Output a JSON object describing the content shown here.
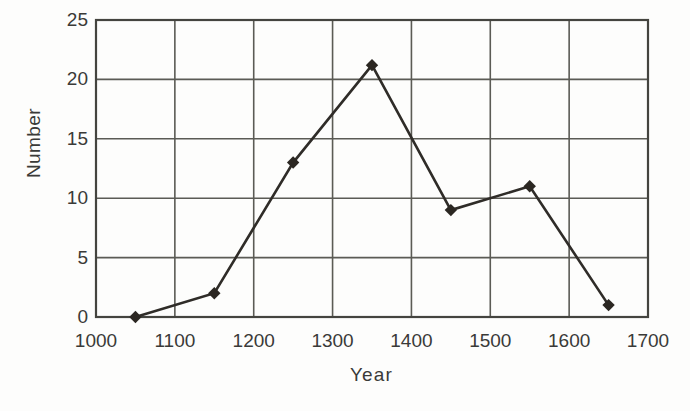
{
  "chart_data": {
    "type": "line",
    "title": "",
    "xlabel": "Year",
    "ylabel": "Number",
    "x": [
      1050,
      1150,
      1250,
      1350,
      1450,
      1550,
      1650
    ],
    "values": [
      0,
      2,
      13,
      21.2,
      9,
      11,
      1
    ],
    "series": [
      {
        "name": "Number",
        "x": [
          1050,
          1150,
          1250,
          1350,
          1450,
          1550,
          1650
        ],
        "values": [
          0,
          2,
          13,
          21.2,
          9,
          11,
          1
        ]
      }
    ],
    "xlim": [
      1000,
      1700
    ],
    "ylim": [
      0,
      25
    ],
    "xticks": [
      1000,
      1100,
      1200,
      1300,
      1400,
      1500,
      1600,
      1700
    ],
    "xtick_labels": [
      "1000",
      "1100",
      "1200",
      "1300",
      "1400",
      "1500",
      "1600",
      "1700"
    ],
    "yticks": [
      0,
      5,
      10,
      15,
      20,
      25
    ],
    "ytick_labels": [
      "0",
      "5",
      "10",
      "15",
      "20",
      "25"
    ],
    "grid": true,
    "grid_x": [
      1100,
      1200,
      1300,
      1400,
      1500,
      1600
    ],
    "grid_y": [
      5,
      10,
      15,
      20
    ],
    "legend": null,
    "marker": "diamond",
    "line_color": "#2f2c28",
    "marker_color": "#2b2722",
    "grid_color": "#5b5b55",
    "axis_color": "#44443f",
    "background_color": "#fdfdfc"
  }
}
